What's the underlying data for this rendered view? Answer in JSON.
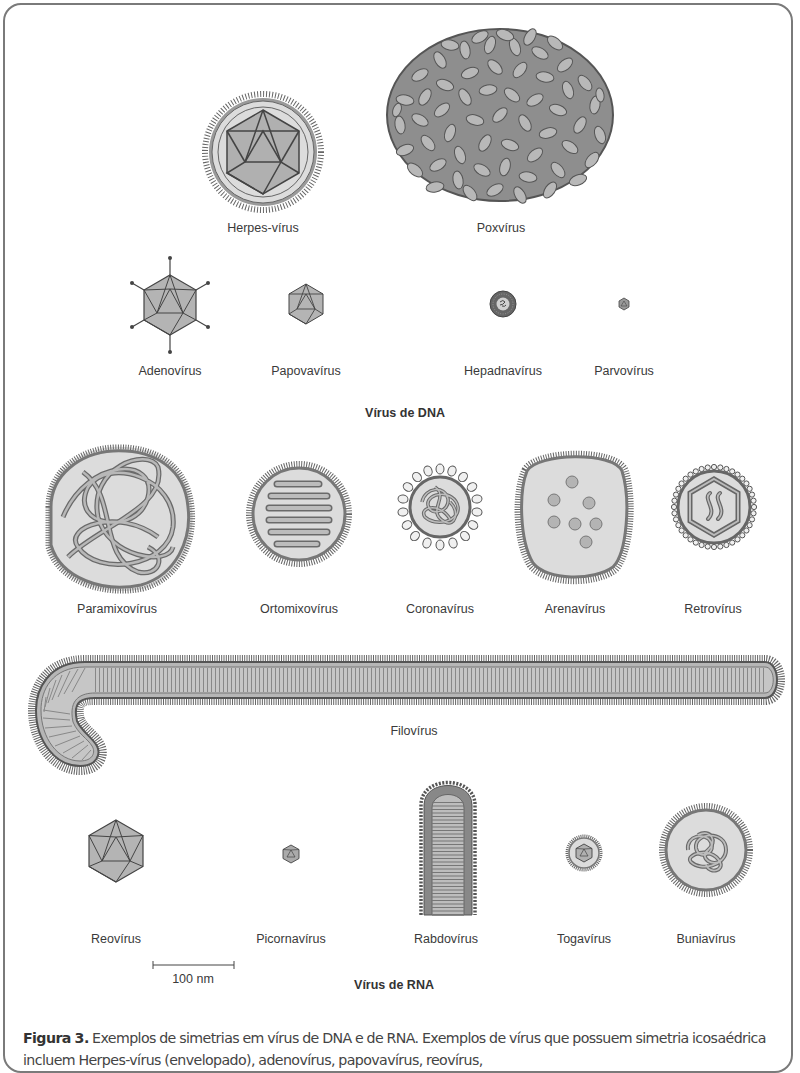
{
  "figure": {
    "dna_section_title": "Vírus de DNA",
    "rna_section_title": "Vírus de RNA",
    "scale_bar_label": "100 nm",
    "dna_viruses": [
      {
        "name": "Herpes-vírus",
        "shape": "enveloped-icosahedral"
      },
      {
        "name": "Poxvírus",
        "shape": "ovoid-brick"
      },
      {
        "name": "Adenovírus",
        "shape": "icosahedral-with-fibers"
      },
      {
        "name": "Papovavírus",
        "shape": "icosahedral"
      },
      {
        "name": "Hepadnavírus",
        "shape": "enveloped-spherical"
      },
      {
        "name": "Parvovírus",
        "shape": "small-icosahedral"
      }
    ],
    "rna_viruses": [
      {
        "name": "Paramixovírus",
        "shape": "enveloped-helical"
      },
      {
        "name": "Ortomixovírus",
        "shape": "enveloped-helical"
      },
      {
        "name": "Coronavírus",
        "shape": "enveloped-helical-crown"
      },
      {
        "name": "Arenavírus",
        "shape": "enveloped-granular"
      },
      {
        "name": "Retrovírus",
        "shape": "enveloped-icosahedral-core"
      },
      {
        "name": "Filovírus",
        "shape": "filamentous"
      },
      {
        "name": "Reovírus",
        "shape": "icosahedral"
      },
      {
        "name": "Picornavírus",
        "shape": "small-icosahedral"
      },
      {
        "name": "Rabdovírus",
        "shape": "bullet"
      },
      {
        "name": "Togavírus",
        "shape": "enveloped-icosahedral"
      },
      {
        "name": "Buniavírus",
        "shape": "enveloped-helical"
      }
    ]
  },
  "caption": {
    "label": "Figura 3.",
    "text": " Exemplos de simetrias em vírus de DNA e de RNA. Exemplos de vírus que possuem simetria icosaédrica incluem Herpes-vírus (envelopado), adenovírus, papovavírus, reovírus,"
  },
  "colors": {
    "frame": "#7a7a7a",
    "capsid_fill": "#b4b4b4",
    "envelope_fill": "#dcdcdc",
    "outline": "#555555"
  }
}
